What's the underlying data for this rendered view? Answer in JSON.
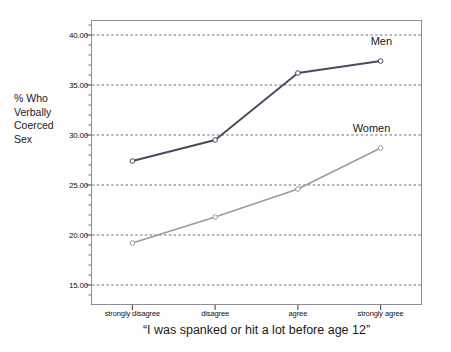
{
  "chart_data": {
    "type": "line",
    "title": "",
    "xlabel": "“I was spanked or hit a lot before age 12”",
    "ylabel": "% Who\nVerbally\nCoerced\nSex",
    "categories": [
      "strongly disagree",
      "disagree",
      "agree",
      "strongly agree"
    ],
    "ylim": [
      13.0,
      41.5
    ],
    "yticks": [
      15.0,
      20.0,
      25.0,
      30.0,
      35.0,
      40.0
    ],
    "ytick_labels": [
      "15.00",
      "20.00",
      "25.00",
      "30.00",
      "35.00",
      "40.00"
    ],
    "grid": true,
    "grid_style": "dashed",
    "legend_position": "inline-annotation",
    "series": [
      {
        "name": "Men",
        "color": "#4a4a5e",
        "values": [
          27.4,
          29.5,
          36.2,
          37.4
        ],
        "marker": "circle-open"
      },
      {
        "name": "Women",
        "color": "#9a9a9a",
        "values": [
          19.2,
          21.8,
          24.6,
          28.7
        ],
        "marker": "circle-open"
      }
    ],
    "annotations": [
      {
        "text": "Men",
        "series": "Men"
      },
      {
        "text": "Women",
        "series": "Women"
      }
    ]
  },
  "axis": {
    "y_title": "% Who\nVerbally\nCoerced\nSex",
    "x_title": "“I was spanked or hit a lot before age 12”"
  },
  "colors": {
    "men_line": "#4a4a5e",
    "women_line": "#9a9a9a",
    "grid": "#555a7a",
    "frame": "#8c8c92",
    "background": "#ffffff"
  }
}
